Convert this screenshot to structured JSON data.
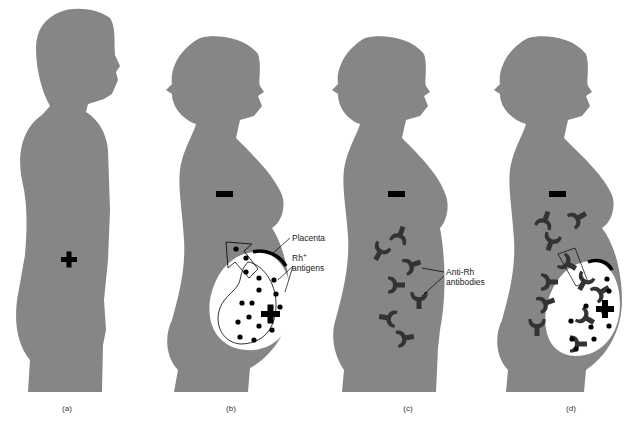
{
  "figure": {
    "colors": {
      "silhouette": "#868686",
      "symbol": "#000000",
      "antibody": "#333333",
      "uterus": "#ffffff"
    },
    "panels": [
      {
        "id": "a",
        "label": "(a)",
        "figure": "male-silhouette",
        "symbol": "+",
        "meaning": "Rh-positive"
      },
      {
        "id": "b",
        "label": "(b)",
        "figure": "pregnant-female-silhouette",
        "symbol": "-",
        "fetus_symbol": "+"
      },
      {
        "id": "c",
        "label": "(c)",
        "figure": "female-silhouette",
        "symbol": "-"
      },
      {
        "id": "d",
        "label": "(d)",
        "figure": "pregnant-female-silhouette",
        "symbol": "-",
        "fetus_symbol": "+"
      }
    ],
    "callouts": {
      "placenta": "Placenta",
      "rh_antigens_base": "Rh",
      "rh_antigens_sup": "+",
      "rh_antigens_line2": "antigens",
      "anti_rh_line1": "Anti-Rh",
      "anti_rh_line2": "antibodies"
    }
  }
}
